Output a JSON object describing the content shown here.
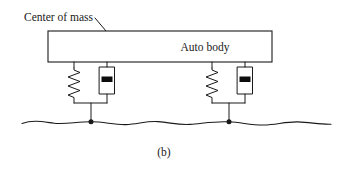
{
  "figure": {
    "caption": "(b)",
    "background_color": "#ffffff",
    "line_color": "#1a1a1a",
    "width": 354,
    "height": 169
  },
  "labels": {
    "center_of_mass": "Center of mass",
    "auto_body": "Auto body"
  },
  "diagram": {
    "type": "mechanical-schematic",
    "body_block": {
      "label": "Auto body",
      "x": 48,
      "y": 31,
      "width": 224,
      "height": 31
    },
    "center_of_mass_marker": {
      "x": 120,
      "y": 47,
      "radius": 2.6
    },
    "callout_arrow": {
      "from_x": 95,
      "from_y": 18,
      "to_x": 118,
      "to_y": 45
    },
    "suspensions": [
      {
        "name": "front-suspension",
        "spring_x": 74,
        "damper_x": 107,
        "contact_x": 91,
        "top_y": 62,
        "bottom_y": 103,
        "ground_y": 122,
        "spring_coils": 6,
        "damper": {
          "width": 15,
          "height": 27,
          "top_y": 67
        }
      },
      {
        "name": "rear-suspension",
        "spring_x": 212,
        "damper_x": 245,
        "contact_x": 229,
        "top_y": 62,
        "bottom_y": 103,
        "ground_y": 122,
        "spring_coils": 6,
        "damper": {
          "width": 15,
          "height": 27,
          "top_y": 67
        }
      }
    ],
    "ground": {
      "style": "wavy-line",
      "x_start": 22,
      "x_end": 331,
      "y_base": 122,
      "amplitude": 2.5
    }
  }
}
